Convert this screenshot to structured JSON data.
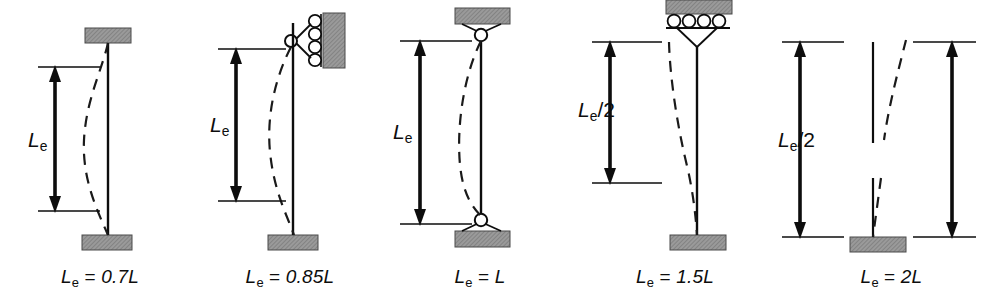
{
  "figure": {
    "width": 1003,
    "height": 306,
    "background": "#ffffff",
    "line_color": "#0d0d0d",
    "support_fill": "#9a9a9a",
    "support_stroke": "#4a4a4a",
    "dashed_color": "#1a1a1a"
  },
  "cases": [
    {
      "id": "fixed-fixed",
      "caption_prefix": "L",
      "caption_sub": "e",
      "caption_eq": " = ",
      "caption_value": "0.7L",
      "caption_full": "Le = 0.7L",
      "dimension_label_main": "L",
      "dimension_label_sub": "e",
      "dimension_label_suffix": "",
      "dimension_full": "Le",
      "top_support": "fixed-block",
      "bottom_support": "fixed-block",
      "effective_length_factor": 0.7,
      "buckled_shape": "double-curvature",
      "dimension_spans": "inflection-point-to-inflection-point"
    },
    {
      "id": "fixed-pinned-roller-wall",
      "caption_prefix": "L",
      "caption_sub": "e",
      "caption_eq": " = ",
      "caption_value": "0.85L",
      "caption_full": "Le = 0.85L",
      "dimension_label_main": "L",
      "dimension_label_sub": "e",
      "dimension_label_suffix": "",
      "dimension_full": "Le",
      "top_support": "pin-on-vertical-rollers",
      "bottom_support": "fixed-block",
      "effective_length_factor": 0.85,
      "buckled_shape": "single-curvature-with-inflection",
      "dimension_spans": "top-pin-to-inflection-point"
    },
    {
      "id": "pinned-pinned",
      "caption_prefix": "L",
      "caption_sub": "e",
      "caption_eq": " = ",
      "caption_value": "L",
      "caption_full": "Le = L",
      "dimension_label_main": "L",
      "dimension_label_sub": "e",
      "dimension_label_suffix": "",
      "dimension_full": "Le",
      "top_support": "pin-to-block",
      "bottom_support": "pin-to-block",
      "effective_length_factor": 1.0,
      "buckled_shape": "single-curvature",
      "dimension_spans": "pin-to-pin"
    },
    {
      "id": "fixed-free-sway",
      "caption_prefix": "L",
      "caption_sub": "e",
      "caption_eq": " = ",
      "caption_value": "1.5L",
      "caption_full": "Le = 1.5L",
      "dimension_label_main": "L",
      "dimension_label_sub": "e",
      "dimension_label_suffix": "/2",
      "dimension_full": "Le/2",
      "top_support": "horizontal-rollers-under-block",
      "bottom_support": "fixed-block",
      "effective_length_factor": 1.5,
      "buckled_shape": "sway-curvature",
      "dimension_spans": "half-effective-length"
    },
    {
      "id": "cantilever",
      "caption_prefix": "L",
      "caption_sub": "e",
      "caption_eq": " = ",
      "caption_value": "2L",
      "caption_full": "Le = 2L",
      "dimension_label_main": "L",
      "dimension_label_sub": "e",
      "dimension_label_suffix": "/2",
      "dimension_full": "Le/2",
      "top_support": "free-end",
      "bottom_support": "fixed-block",
      "effective_length_factor": 2.0,
      "buckled_shape": "cantilever-sway",
      "dimension_spans": "half-effective-length",
      "has_break": true
    }
  ]
}
